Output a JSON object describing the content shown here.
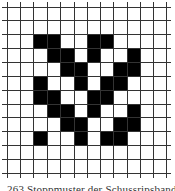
{
  "figure": {
    "caption": "263 Stoppmuster der Schussripsband",
    "grid": {
      "rows": 12,
      "cols": 12,
      "x_lines": [
        7,
        20,
        33,
        47,
        60,
        74,
        87,
        100,
        113,
        127,
        140,
        153,
        166
      ],
      "y_lines": [
        7,
        20,
        34,
        48,
        62,
        76,
        90,
        104,
        117,
        131,
        145,
        159,
        173
      ],
      "line_color": "#333333",
      "fill_color": "#000000",
      "overhang": 5
    },
    "pattern": [
      [
        0,
        0,
        0,
        0,
        0,
        0,
        0,
        0,
        0,
        0,
        0,
        0
      ],
      [
        0,
        0,
        0,
        0,
        0,
        0,
        0,
        0,
        0,
        0,
        0,
        0
      ],
      [
        0,
        0,
        1,
        1,
        0,
        0,
        1,
        1,
        0,
        0,
        0,
        0
      ],
      [
        0,
        0,
        0,
        1,
        1,
        0,
        1,
        0,
        0,
        1,
        0,
        0
      ],
      [
        0,
        0,
        0,
        0,
        1,
        1,
        0,
        0,
        1,
        1,
        0,
        0
      ],
      [
        0,
        0,
        1,
        0,
        0,
        1,
        0,
        1,
        1,
        0,
        0,
        0
      ],
      [
        0,
        0,
        1,
        1,
        0,
        0,
        1,
        1,
        0,
        0,
        0,
        0
      ],
      [
        0,
        0,
        0,
        1,
        1,
        0,
        1,
        0,
        0,
        1,
        0,
        0
      ],
      [
        0,
        0,
        0,
        0,
        1,
        1,
        0,
        0,
        1,
        1,
        0,
        0
      ],
      [
        0,
        0,
        1,
        0,
        0,
        1,
        0,
        1,
        1,
        0,
        0,
        0
      ],
      [
        0,
        0,
        0,
        0,
        0,
        0,
        0,
        0,
        0,
        0,
        0,
        0
      ],
      [
        0,
        0,
        0,
        0,
        0,
        0,
        0,
        0,
        0,
        0,
        0,
        0
      ]
    ]
  }
}
